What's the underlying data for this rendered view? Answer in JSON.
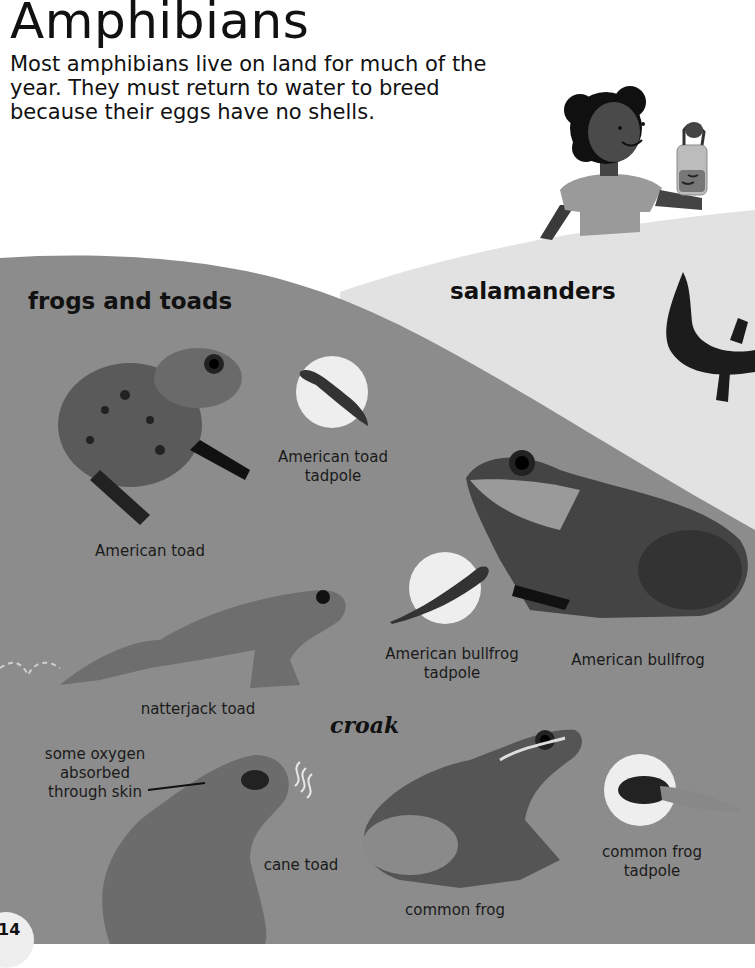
{
  "page": {
    "title": "Amphibians",
    "intro": "Most amphibians live on land for much of the year. They must return to water to breed because their eggs have no shells.",
    "page_number": "14"
  },
  "sections": {
    "frogs_and_toads": "frogs and toads",
    "salamanders": "salamanders"
  },
  "labels": {
    "american_toad": "American toad",
    "american_toad_tadpole_1": "American toad",
    "american_toad_tadpole_2": "tadpole",
    "american_bullfrog": "American bullfrog",
    "american_bullfrog_tadpole_1": "American bullfrog",
    "american_bullfrog_tadpole_2": "tadpole",
    "natterjack_toad": "natterjack toad",
    "cane_toad": "cane toad",
    "common_frog": "common frog",
    "common_frog_tadpole_1": "common frog",
    "common_frog_tadpole_2": "tadpole",
    "oxygen_callout_1": "some oxygen",
    "oxygen_callout_2": "absorbed",
    "oxygen_callout_3": "through skin",
    "croak": "croak"
  },
  "colors": {
    "frog_area": "#8c8c8c",
    "salamander_area": "#e2e2e2",
    "text": "#111111",
    "tadpole_circle": "#eeeeee"
  }
}
